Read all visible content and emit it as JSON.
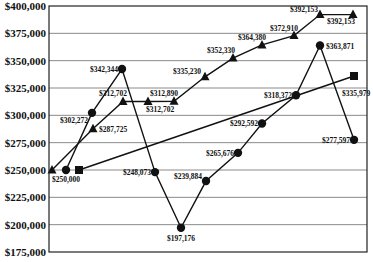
{
  "chart_data": {
    "type": "line",
    "title": "",
    "xlabel": "",
    "ylabel": "",
    "ylim": [
      175000,
      400000
    ],
    "yticks": [
      400000,
      375000,
      350000,
      325000,
      300000,
      275000,
      250000,
      225000,
      200000,
      175000
    ],
    "ytick_labels": [
      "$400,000",
      "$375,000",
      "$350,000",
      "$325,000",
      "$300,000",
      "$275,000",
      "$250,000",
      "$225,000",
      "$200,000",
      "$175,000"
    ],
    "grid": true,
    "legend": null,
    "series": [
      {
        "name": "triangle-series",
        "marker": "triangle",
        "x_px": [
          52,
          93,
          123,
          148,
          174,
          205,
          233,
          262,
          294,
          320,
          353
        ],
        "values": [
          250000,
          287725,
          312702,
          312702,
          312890,
          335230,
          352330,
          364380,
          372910,
          392153,
          392153
        ],
        "labels": [
          "",
          "$287,725",
          "$312,702",
          "$312,702",
          "$312,890",
          "$335,230",
          "$352,330",
          "$364,380",
          "$372,910",
          "$392,153",
          "$392,153"
        ]
      },
      {
        "name": "circle-series",
        "marker": "circle",
        "x_px": [
          66,
          92,
          122,
          155,
          181,
          206,
          238,
          262,
          296,
          320,
          354
        ],
        "values": [
          250000,
          302272,
          342344,
          248073,
          197176,
          239884,
          265676,
          292592,
          318372,
          363871,
          277597
        ],
        "labels": [
          "$250,000",
          "$302,272",
          "$342,344",
          "$248,073",
          "$197,176",
          "$239,884",
          "$265,676",
          "$292,592",
          "$318,372",
          "$363,871",
          "$277,597"
        ]
      },
      {
        "name": "square-series",
        "marker": "square",
        "x_px": [
          79,
          354
        ],
        "values": [
          250000,
          335979
        ],
        "labels": [
          "",
          "$335,979"
        ]
      }
    ]
  }
}
